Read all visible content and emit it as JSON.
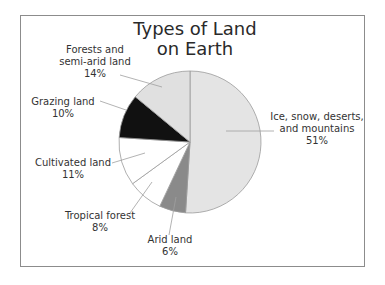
{
  "chart_data": {
    "type": "pie",
    "title": "Types of Land on Earth",
    "title_lines": [
      "Types of Land",
      "on Earth"
    ],
    "start_angle_deg": 0,
    "direction": "clockwise",
    "slices": [
      {
        "name": "Ice, snow, deserts, and mountains",
        "lines": [
          "Ice, snow, deserts,",
          "and mountains"
        ],
        "value": 51,
        "pct_label": "51%",
        "color": "#e4e4e4"
      },
      {
        "name": "Arid land",
        "lines": [
          "Arid land"
        ],
        "value": 6,
        "pct_label": "6%",
        "color": "#8a8a8a"
      },
      {
        "name": "Tropical forest",
        "lines": [
          "Tropical forest"
        ],
        "value": 8,
        "pct_label": "8%",
        "color": "#ffffff"
      },
      {
        "name": "Cultivated land",
        "lines": [
          "Cultivated land"
        ],
        "value": 11,
        "pct_label": "11%",
        "color": "#ffffff"
      },
      {
        "name": "Grazing land",
        "lines": [
          "Grazing land"
        ],
        "value": 10,
        "pct_label": "10%",
        "color": "#111111"
      },
      {
        "name": "Forests and semi-arid land",
        "lines": [
          "Forests and",
          "semi-arid land"
        ],
        "value": 14,
        "pct_label": "14%",
        "color": "#e0e0e0"
      }
    ],
    "legend": "none (callout labels with leader lines)"
  }
}
